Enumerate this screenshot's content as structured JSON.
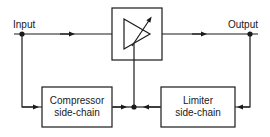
{
  "diagram": {
    "type": "block-diagram",
    "colors": {
      "line": "#1a1a1a",
      "background": "#ffffff"
    },
    "labels": {
      "input": "Input",
      "output": "Output"
    },
    "blocks": [
      {
        "id": "vca",
        "label": "",
        "symbol": "variable-gain-amplifier"
      },
      {
        "id": "compressor",
        "line1": "Compressor",
        "line2": "side-chain"
      },
      {
        "id": "limiter",
        "line1": "Limiter",
        "line2": "side-chain"
      }
    ],
    "connections": [
      {
        "from": "input",
        "to": "vca"
      },
      {
        "from": "vca",
        "to": "output"
      },
      {
        "from": "input",
        "to": "compressor"
      },
      {
        "from": "output",
        "to": "limiter"
      },
      {
        "from": "compressor",
        "to": "vca-control"
      },
      {
        "from": "limiter",
        "to": "vca-control"
      }
    ]
  }
}
